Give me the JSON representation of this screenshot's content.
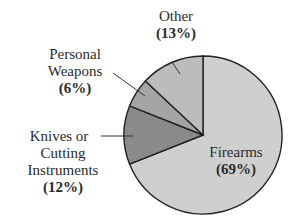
{
  "chart_data": {
    "type": "pie",
    "title": "",
    "start_angle_deg": 0,
    "direction": "clockwise",
    "slices": [
      {
        "label": "Firearms",
        "value": 69,
        "value_label": "(69%)",
        "color": "#cfcfcf"
      },
      {
        "label": "Knives or Cutting Instruments",
        "value": 12,
        "value_label": "(12%)",
        "color": "#8a8a8a"
      },
      {
        "label": "Personal Weapons",
        "value": 6,
        "value_label": "(6%)",
        "color": "#a4a4a4"
      },
      {
        "label": "Other",
        "value": 13,
        "value_label": "(13%)",
        "color": "#bcbcbc"
      }
    ],
    "legend": "none (direct labels with leader lines)"
  },
  "labels": {
    "firearms": {
      "line1": "Firearms",
      "pct": "(69%)"
    },
    "knives": {
      "line1": "Knives or",
      "line2": "Cutting",
      "line3": "Instruments",
      "pct": "(12%)"
    },
    "personal": {
      "line1": "Personal",
      "line2": "Weapons",
      "pct": "(6%)"
    },
    "other": {
      "line1": "Other",
      "pct": "(13%)"
    }
  }
}
